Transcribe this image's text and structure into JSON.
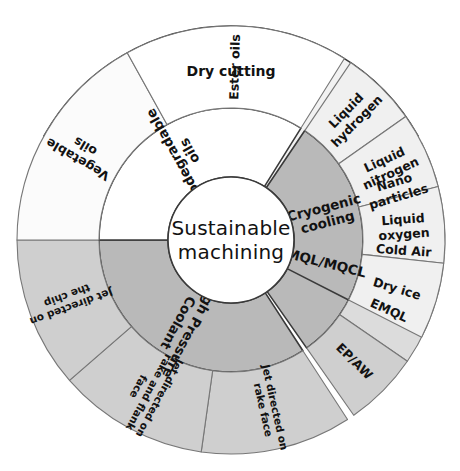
{
  "diagram": {
    "center": {
      "line1": "Sustainable",
      "line2": "machining"
    },
    "geometry": {
      "cx": 231,
      "cy": 240,
      "r_center": 63,
      "r_inner": 132,
      "r_outer": 214
    },
    "colors": {
      "center_fill": "#ffffff",
      "dry_cutting_fill": "#f2f2f2",
      "inner_dark_gray": "#b9b9b9",
      "outer_light_gray": "#dcdcdc",
      "outer_mid_gray": "#cfcfcf",
      "outer_white": "#ffffff",
      "stroke_main": "#3a3a3a",
      "stroke_sub": "#777777",
      "text": "#121212",
      "background": "#ffffff"
    },
    "sectors": [
      {
        "id": "dry-cutting",
        "label": "Dry cutting",
        "start_angle": -61,
        "end_angle": 61,
        "fill": "#f2f2f2",
        "spans_full_radius": true,
        "label_radius": 168,
        "label_rotation": 0,
        "children": []
      },
      {
        "id": "mql-mqcl",
        "label": "MQL/MQCL",
        "start_angle": 63,
        "end_angle": 145,
        "fill": "#b9b9b9",
        "spans_full_radius": false,
        "label_radius": 98,
        "children": [
          {
            "id": "nano-particles",
            "label": "Nano particles",
            "fill": "#dcdcdc",
            "lines": [
              "Nano",
              "particles"
            ]
          },
          {
            "id": "cold-air",
            "label": "Cold Air",
            "fill": "#dcdcdc",
            "lines": [
              "Cold Air"
            ]
          },
          {
            "id": "emql",
            "label": "EMQL",
            "fill": "#dcdcdc",
            "lines": [
              "EMQL"
            ]
          },
          {
            "id": "ep-aw",
            "label": "EP/AW",
            "fill": "#cfcfcf",
            "lines": [
              "EP/AW"
            ]
          }
        ]
      },
      {
        "id": "high-pressure-coolant",
        "label": "High Pressure Coolant",
        "start_angle": 147,
        "end_angle": 270,
        "fill": "#b9b9b9",
        "spans_full_radius": false,
        "label_radius": 98,
        "children": [
          {
            "id": "jet-rake-face",
            "label": "Jet directed on rake face",
            "fill": "#cfcfcf",
            "lines": [
              "Jet directed on",
              "rake face"
            ]
          },
          {
            "id": "jet-rake-flank-face",
            "label": "Jet directed on rake and flank face",
            "fill": "#cfcfcf",
            "lines": [
              "Jet directed on",
              "rake and flank",
              "face"
            ]
          },
          {
            "id": "jet-chip",
            "label": "Jet directed on the chip",
            "fill": "#cfcfcf",
            "lines": [
              "Jet directed on",
              "the chip"
            ]
          }
        ]
      },
      {
        "id": "biodegradable-oils",
        "label": "Biodegradable oils",
        "start_angle": 270,
        "end_angle": 392,
        "fill": "#ffffff",
        "spans_full_radius": false,
        "label_radius": 98,
        "children": [
          {
            "id": "vegetable-oils",
            "label": "Vegetable oils",
            "fill": "#fbfbfb",
            "lines": [
              "Vegetable",
              "oils"
            ]
          },
          {
            "id": "ester-oils",
            "label": "Ester oils",
            "fill": "#ffffff",
            "lines": [
              "Ester oils"
            ]
          }
        ]
      },
      {
        "id": "cryogenic-cooling",
        "label": "Cryogenic cooling",
        "start_angle": 394,
        "end_angle": 477,
        "fill": "#b9b9b9",
        "spans_full_radius": false,
        "label_radius": 98,
        "children": [
          {
            "id": "liquid-hydrogen",
            "label": "Liquid hydrogen",
            "fill": "#f0f0f0",
            "lines": [
              "Liquid",
              "hydrogen"
            ]
          },
          {
            "id": "liquid-nitrogen",
            "label": "Liquid nitrogen",
            "fill": "#f0f0f0",
            "lines": [
              "Liquid",
              "nitrogen"
            ]
          },
          {
            "id": "liquid-oxygen",
            "label": "Liquid oxygen",
            "fill": "#f0f0f0",
            "lines": [
              "Liquid",
              "oxygen"
            ]
          },
          {
            "id": "dry-ice",
            "label": "Dry ice",
            "fill": "#f0f0f0",
            "lines": [
              "Dry ice"
            ]
          }
        ]
      }
    ]
  }
}
